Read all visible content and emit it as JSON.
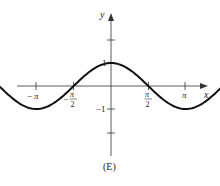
{
  "chart_data": {
    "type": "line",
    "title": "",
    "caption": "(E)",
    "function": "y = cos(2x)",
    "xlabel": "x",
    "ylabel": "y",
    "xlim": [
      -3.5,
      3.5
    ],
    "ylim": [
      -2.5,
      2.5
    ],
    "x_ticks": [
      {
        "value": -3.14159,
        "label": "−π"
      },
      {
        "value": -1.5708,
        "label": "−π/2"
      },
      {
        "value": 1.5708,
        "label": "π/2"
      },
      {
        "value": 3.14159,
        "label": "π"
      }
    ],
    "y_ticks": [
      {
        "value": 2,
        "label": ""
      },
      {
        "value": 1,
        "label": "1"
      },
      {
        "value": -1,
        "label": "−1"
      },
      {
        "value": -2,
        "label": ""
      }
    ],
    "series": [
      {
        "name": "cos(2x)",
        "x": [
          -3.48,
          -3.14159,
          -2.3562,
          -1.5708,
          -0.7854,
          0,
          0.7854,
          1.5708,
          2.3562,
          3.14159,
          3.48
        ],
        "y": [
          0.77,
          1,
          0,
          -1,
          0,
          1,
          0,
          -1,
          0,
          1,
          0.77
        ]
      }
    ],
    "grid": false,
    "legend": null
  },
  "labels": {
    "x_axis": "x",
    "y_axis": "y",
    "pi": "π",
    "neg": "−",
    "two": "2",
    "one": "1",
    "neg_one": "−1",
    "caption": "(E)"
  }
}
